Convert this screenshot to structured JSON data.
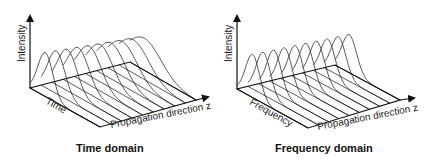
{
  "panels": [
    {
      "id": "time-domain",
      "caption": "Time domain",
      "y_axis_label": "Intensity",
      "depth_axis_label": "Time",
      "x_axis_label": "Propagation direction z",
      "pulse_count": 10,
      "pulse_shape": "broadening",
      "geometry": {
        "origin": [
          30,
          88
        ],
        "y_top": 12,
        "front_corner": [
          100,
          127
        ],
        "back_corner": [
          130,
          62
        ],
        "right_corner": [
          196,
          100
        ],
        "arrow_tip": [
          212,
          96
        ],
        "start_height": 44,
        "end_height": 32,
        "start_width": 3.2,
        "end_width": 7.5
      }
    },
    {
      "id": "frequency-domain",
      "caption": "Frequency domain",
      "y_axis_label": "Intensity",
      "depth_axis_label": "Frequency",
      "x_axis_label": "Propagation direction z",
      "pulse_count": 10,
      "pulse_shape": "constant",
      "geometry": {
        "origin": [
          237,
          89
        ],
        "y_top": 12,
        "front_corner": [
          308,
          128
        ],
        "back_corner": [
          335,
          65
        ],
        "right_corner": [
          400,
          100
        ],
        "arrow_tip": [
          418,
          97
        ],
        "start_height": 43,
        "end_height": 38,
        "start_width": 3.0,
        "end_width": 3.4
      }
    }
  ],
  "colors": {
    "axis": "#111111",
    "pulse": "#444444",
    "text": "#222222"
  }
}
